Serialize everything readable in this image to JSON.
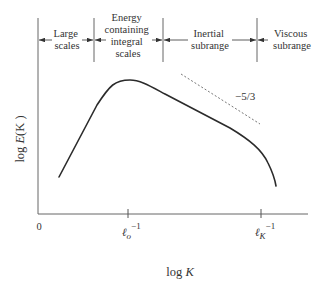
{
  "diagram": {
    "regions": [
      {
        "id": "large",
        "lines": [
          "Large",
          "scales"
        ]
      },
      {
        "id": "energy",
        "lines": [
          "Energy",
          "containing",
          "integral",
          "scales"
        ]
      },
      {
        "id": "inertial",
        "lines": [
          "Inertial",
          "subrange"
        ]
      },
      {
        "id": "viscous",
        "lines": [
          "Viscous",
          "subrange"
        ]
      }
    ],
    "slope_label": "−5/3",
    "y_axis_label": "log E(K)",
    "y_axis_label_parts": {
      "pre": "log ",
      "italic": "E",
      "post": "(K )"
    },
    "x_axis_label_parts": {
      "pre": "log ",
      "italic": "K"
    },
    "origin_label": "0",
    "x_ticks": [
      {
        "id": "l0",
        "base": "ℓ",
        "sub": "o",
        "sup": "−1"
      },
      {
        "id": "lK",
        "base": "ℓ",
        "sub": "K",
        "sup": "−1"
      }
    ],
    "colors": {
      "curve": "#2b2b2b",
      "axis": "#555555",
      "dashed": "#777777"
    }
  }
}
